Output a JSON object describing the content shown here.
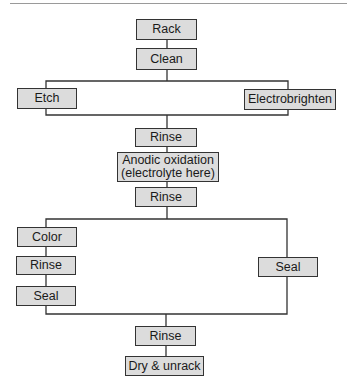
{
  "diagram": {
    "type": "process-flowchart",
    "nodes": [
      {
        "id": "rack",
        "label": "Rack",
        "x": 136,
        "y": 19,
        "w": 61,
        "h": 21
      },
      {
        "id": "clean",
        "label": "Clean",
        "x": 136,
        "y": 48,
        "w": 61,
        "h": 22
      },
      {
        "id": "etch",
        "label": "Etch",
        "x": 17,
        "y": 88,
        "w": 60,
        "h": 21
      },
      {
        "id": "electrobrighten",
        "label": "Electrobrighten",
        "x": 244,
        "y": 89,
        "w": 92,
        "h": 21
      },
      {
        "id": "rinse1",
        "label": "Rinse",
        "x": 135,
        "y": 128,
        "w": 62,
        "h": 19
      },
      {
        "id": "anodic",
        "label": "Anodic oxidation\n(electrolyte here)",
        "label_line1": "Anodic oxidation",
        "label_line2": "(electrolyte here)",
        "x": 117,
        "y": 152,
        "w": 102,
        "h": 30
      },
      {
        "id": "rinse2",
        "label": "Rinse",
        "x": 135,
        "y": 187,
        "w": 62,
        "h": 20
      },
      {
        "id": "color",
        "label": "Color",
        "x": 17,
        "y": 227,
        "w": 60,
        "h": 20
      },
      {
        "id": "rinse3",
        "label": "Rinse",
        "x": 16,
        "y": 256,
        "w": 60,
        "h": 19
      },
      {
        "id": "seal_left",
        "label": "Seal",
        "x": 16,
        "y": 286,
        "w": 60,
        "h": 20
      },
      {
        "id": "seal_right",
        "label": "Seal",
        "x": 258,
        "y": 257,
        "w": 60,
        "h": 20
      },
      {
        "id": "rinse4",
        "label": "Rinse",
        "x": 135,
        "y": 326,
        "w": 61,
        "h": 20
      },
      {
        "id": "dry",
        "label": "Dry & unrack",
        "x": 125,
        "y": 356,
        "w": 79,
        "h": 20
      }
    ],
    "edges": [
      [
        "rack",
        "clean"
      ],
      [
        "clean",
        "etch"
      ],
      [
        "clean",
        "electrobrighten"
      ],
      [
        "etch",
        "rinse1"
      ],
      [
        "electrobrighten",
        "rinse1"
      ],
      [
        "rinse1",
        "anodic"
      ],
      [
        "anodic",
        "rinse2"
      ],
      [
        "rinse2",
        "color"
      ],
      [
        "rinse2",
        "seal_right"
      ],
      [
        "color",
        "rinse3"
      ],
      [
        "rinse3",
        "seal_left"
      ],
      [
        "seal_left",
        "rinse4"
      ],
      [
        "seal_right",
        "rinse4"
      ],
      [
        "rinse4",
        "dry"
      ]
    ],
    "colors": {
      "box_fill": "#dcdcdc",
      "box_border": "#333333",
      "line": "#333333",
      "rule": "#9a9a9a"
    }
  }
}
